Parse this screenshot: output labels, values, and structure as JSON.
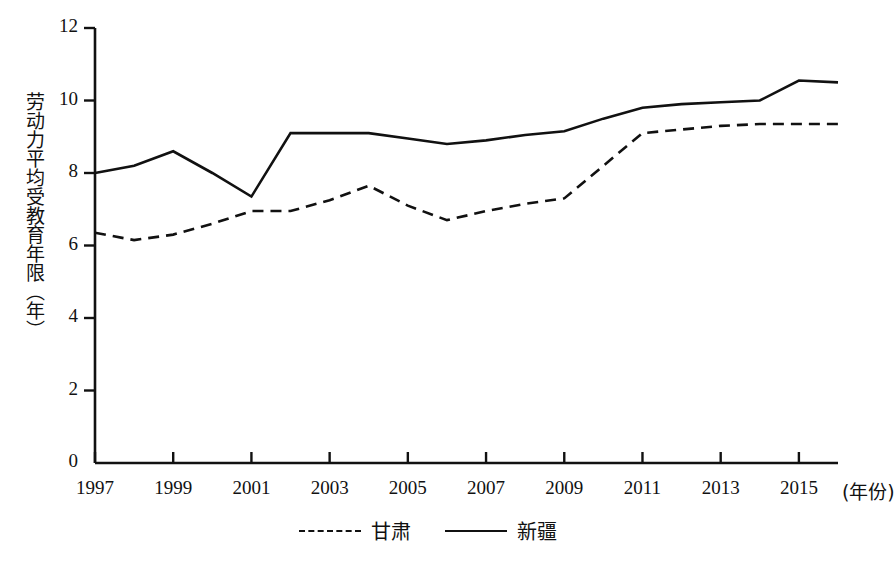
{
  "chart_data": {
    "type": "line",
    "title": "",
    "xlabel": "(年份)",
    "ylabel": "劳动力平均受教育年限（年）",
    "x": [
      1997,
      1998,
      1999,
      2000,
      2001,
      2002,
      2003,
      2004,
      2005,
      2006,
      2007,
      2008,
      2009,
      2010,
      2011,
      2012,
      2013,
      2014,
      2015,
      2016
    ],
    "xlim": [
      1997,
      2016
    ],
    "ylim": [
      0,
      12
    ],
    "yticks": [
      0,
      2,
      4,
      6,
      8,
      10,
      12
    ],
    "xticks": [
      1997,
      1999,
      2001,
      2003,
      2005,
      2007,
      2009,
      2011,
      2013,
      2015
    ],
    "xtick_labels": [
      "1997",
      "1999",
      "2001",
      "2003",
      "2005",
      "2007",
      "2009",
      "2011",
      "2013",
      "2015"
    ],
    "ytick_labels": [
      "0",
      "2",
      "4",
      "6",
      "8",
      "10",
      "12"
    ],
    "grid": false,
    "legend_position": "bottom-center",
    "series": [
      {
        "name": "甘肃",
        "style": "dashed",
        "color": "#111111",
        "values": [
          6.35,
          6.15,
          6.3,
          6.6,
          6.95,
          6.95,
          7.25,
          7.65,
          7.1,
          6.7,
          6.95,
          7.15,
          7.3,
          8.2,
          9.1,
          9.2,
          9.3,
          9.35,
          9.35,
          9.35
        ]
      },
      {
        "name": "新疆",
        "style": "solid",
        "color": "#111111",
        "values": [
          8.0,
          8.2,
          8.6,
          8.0,
          7.35,
          9.1,
          9.1,
          9.1,
          8.95,
          8.8,
          8.9,
          9.05,
          9.15,
          9.5,
          9.8,
          9.9,
          9.95,
          10.0,
          10.55,
          10.5
        ]
      }
    ]
  },
  "axes": {
    "y_title": "劳动力平均受教育年限（年）",
    "x_title": "(年份)"
  },
  "legend": {
    "items": [
      {
        "label": "甘肃",
        "style": "dashed"
      },
      {
        "label": "新疆",
        "style": "solid"
      }
    ]
  }
}
